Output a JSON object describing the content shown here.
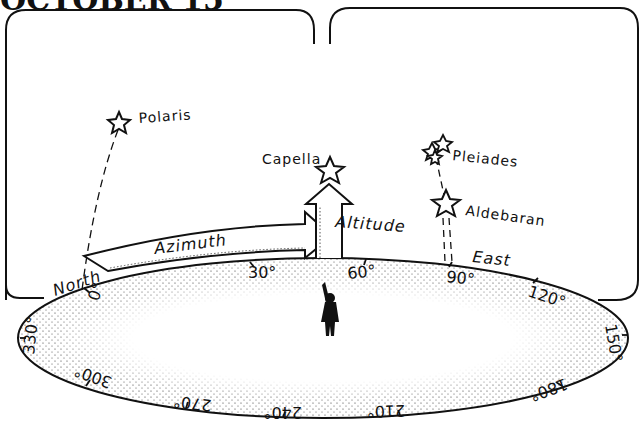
{
  "title": "OCTOBER 15",
  "stars": [
    {
      "name": "Polaris",
      "label": "Polaris"
    },
    {
      "name": "Capella",
      "label": "Capella"
    },
    {
      "name": "Pleiades",
      "label": "Pleiades"
    },
    {
      "name": "Aldebaran",
      "label": "Aldebaran"
    }
  ],
  "arrows": {
    "azimuth": "Azimuth",
    "altitude": "Altitude"
  },
  "directions": {
    "north": "North",
    "east": "East"
  },
  "horizon_degrees": [
    "0°",
    "30°",
    "60°",
    "90°",
    "120°",
    "150°",
    "180°",
    "210°",
    "240°",
    "270°",
    "300°",
    "330°"
  ],
  "colors": {
    "ink": "#111111",
    "paper": "#ffffff"
  }
}
